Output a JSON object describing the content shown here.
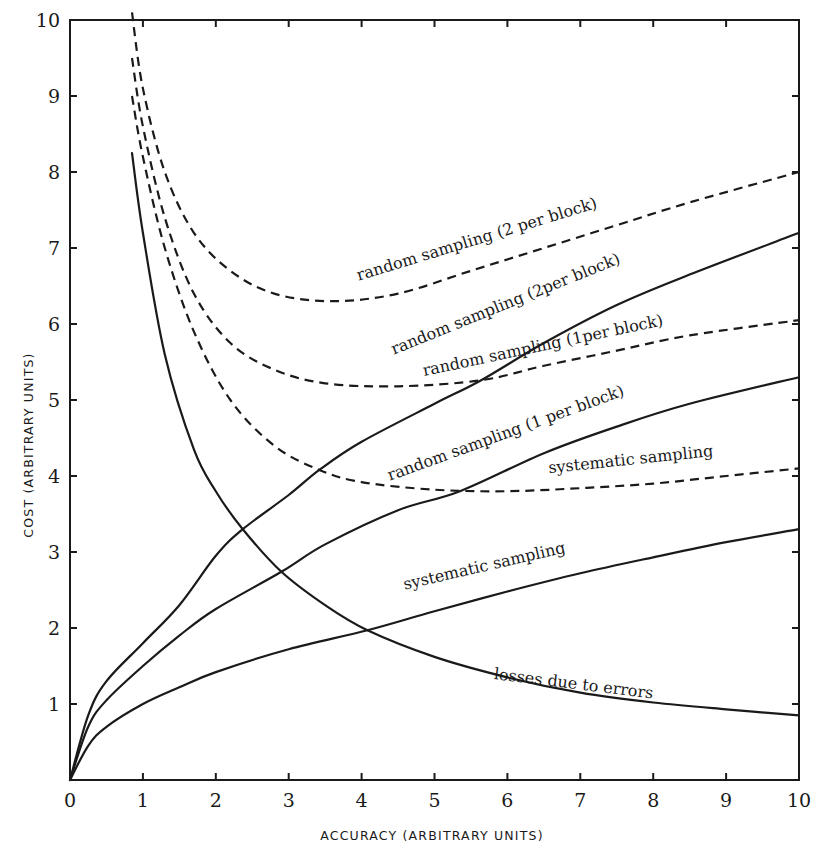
{
  "chart_data": {
    "type": "line",
    "title": "",
    "xlabel": "ACCURACY (ARBITRARY UNITS)",
    "ylabel": "COST (ARBITRARY UNITS)",
    "xlim": [
      0,
      10
    ],
    "ylim": [
      0,
      10
    ],
    "x_ticks": [
      "0",
      "1",
      "2",
      "3",
      "4",
      "5",
      "6",
      "7",
      "8",
      "9",
      "10"
    ],
    "y_ticks": [
      "0",
      "1",
      "2",
      "3",
      "4",
      "5",
      "6",
      "7",
      "8",
      "9",
      "10"
    ],
    "grid": false,
    "legend": "inline labels on curves",
    "series": [
      {
        "name": "random sampling (2 per block) — total cost",
        "style": "dashed",
        "label": "random sampling (2 per block)",
        "points": [
          [
            0.85,
            10.1
          ],
          [
            1.0,
            9.1
          ],
          [
            1.3,
            8.0
          ],
          [
            1.7,
            7.2
          ],
          [
            2.2,
            6.7
          ],
          [
            2.8,
            6.4
          ],
          [
            3.6,
            6.3
          ],
          [
            4.5,
            6.4
          ],
          [
            5.5,
            6.7
          ],
          [
            6.5,
            7.0
          ],
          [
            7.5,
            7.3
          ],
          [
            8.5,
            7.6
          ],
          [
            10,
            8.0
          ]
        ]
      },
      {
        "name": "random sampling (2 per block) — sampling cost",
        "style": "solid",
        "label": "random sampling (2 per block)",
        "points": [
          [
            0,
            0
          ],
          [
            0.25,
            0.85
          ],
          [
            0.5,
            1.3
          ],
          [
            1.0,
            1.8
          ],
          [
            1.5,
            2.3
          ],
          [
            2.0,
            2.95
          ],
          [
            2.37,
            3.3
          ],
          [
            3.0,
            3.75
          ],
          [
            3.42,
            4.08
          ],
          [
            4.0,
            4.45
          ],
          [
            5.0,
            4.95
          ],
          [
            5.64,
            5.26
          ],
          [
            6.5,
            5.75
          ],
          [
            7.5,
            6.25
          ],
          [
            8.5,
            6.65
          ],
          [
            10,
            7.2
          ]
        ]
      },
      {
        "name": "random sampling (1 per block) — total cost",
        "style": "dashed",
        "label": "random sampling (1 per block)",
        "points": [
          [
            0.85,
            9.5
          ],
          [
            1.0,
            8.6
          ],
          [
            1.3,
            7.4
          ],
          [
            1.7,
            6.4
          ],
          [
            2.2,
            5.75
          ],
          [
            2.8,
            5.4
          ],
          [
            3.5,
            5.22
          ],
          [
            4.5,
            5.18
          ],
          [
            5.64,
            5.26
          ],
          [
            6.5,
            5.45
          ],
          [
            7.5,
            5.65
          ],
          [
            8.5,
            5.85
          ],
          [
            10,
            6.05
          ]
        ]
      },
      {
        "name": "random sampling (1 per block) — sampling cost",
        "style": "solid",
        "label": "random sampling (1 per block)",
        "points": [
          [
            0,
            0
          ],
          [
            0.25,
            0.7
          ],
          [
            0.5,
            1.05
          ],
          [
            1.0,
            1.5
          ],
          [
            1.5,
            1.9
          ],
          [
            2.0,
            2.25
          ],
          [
            2.9,
            2.74
          ],
          [
            3.5,
            3.1
          ],
          [
            4.5,
            3.55
          ],
          [
            5.35,
            3.8
          ],
          [
            6.5,
            4.3
          ],
          [
            7.5,
            4.65
          ],
          [
            8.5,
            4.95
          ],
          [
            10,
            5.3
          ]
        ]
      },
      {
        "name": "systematic sampling — total cost",
        "style": "dashed",
        "label": "systematic sampling",
        "points": [
          [
            0.85,
            9.0
          ],
          [
            1.0,
            8.2
          ],
          [
            1.3,
            7.0
          ],
          [
            1.7,
            5.9
          ],
          [
            2.2,
            5.0
          ],
          [
            2.8,
            4.4
          ],
          [
            3.42,
            4.08
          ],
          [
            4.0,
            3.92
          ],
          [
            5.0,
            3.82
          ],
          [
            6.0,
            3.8
          ],
          [
            7.0,
            3.84
          ],
          [
            8.0,
            3.9
          ],
          [
            9.0,
            4.0
          ],
          [
            10,
            4.1
          ]
        ]
      },
      {
        "name": "systematic sampling — sampling cost",
        "style": "solid",
        "label": "systematic sampling",
        "points": [
          [
            0,
            0
          ],
          [
            0.25,
            0.45
          ],
          [
            0.5,
            0.7
          ],
          [
            1.0,
            1.0
          ],
          [
            1.5,
            1.22
          ],
          [
            2.0,
            1.42
          ],
          [
            3.0,
            1.72
          ],
          [
            4.08,
            1.97
          ],
          [
            5.0,
            2.22
          ],
          [
            6.0,
            2.48
          ],
          [
            7.0,
            2.72
          ],
          [
            8.0,
            2.93
          ],
          [
            9.0,
            3.13
          ],
          [
            10,
            3.3
          ]
        ]
      },
      {
        "name": "losses due to errors",
        "style": "solid",
        "label": "losses due to errors",
        "points": [
          [
            0.85,
            8.25
          ],
          [
            1.0,
            7.2
          ],
          [
            1.3,
            5.6
          ],
          [
            1.7,
            4.35
          ],
          [
            2.0,
            3.8
          ],
          [
            2.37,
            3.3
          ],
          [
            2.9,
            2.74
          ],
          [
            3.5,
            2.3
          ],
          [
            4.08,
            1.97
          ],
          [
            5.0,
            1.62
          ],
          [
            6.0,
            1.35
          ],
          [
            7.0,
            1.15
          ],
          [
            8.0,
            1.02
          ],
          [
            9.0,
            0.93
          ],
          [
            10,
            0.85
          ]
        ]
      }
    ],
    "annotations": [
      {
        "text": "random sampling (2 per block)",
        "x": 5.6,
        "y": 7.05,
        "angle": -17
      },
      {
        "text": "random sampling (2per block)",
        "x": 6.0,
        "y": 6.2,
        "angle": -22
      },
      {
        "text": "random sampling (1per block)",
        "x": 6.5,
        "y": 5.65,
        "angle": -12
      },
      {
        "text": "random sampling (1 per block)",
        "x": 6.0,
        "y": 4.5,
        "angle": -20
      },
      {
        "text": "systematic sampling",
        "x": 7.7,
        "y": 4.15,
        "angle": -6
      },
      {
        "text": "systematic sampling",
        "x": 5.7,
        "y": 2.75,
        "angle": -13
      },
      {
        "text": "losses due to errors",
        "x": 6.9,
        "y": 1.2,
        "angle": 7
      }
    ]
  },
  "labels": {
    "xlabel": "ACCURACY (ARBITRARY UNITS)",
    "ylabel": "COST (ARBITRARY UNITS)",
    "curve_labels": [
      "random sampling (2 per block)",
      "random sampling (2per block)",
      "random sampling (1per block)",
      "random sampling (1 per block)",
      "systematic sampling",
      "systematic sampling",
      "losses due to errors"
    ]
  }
}
